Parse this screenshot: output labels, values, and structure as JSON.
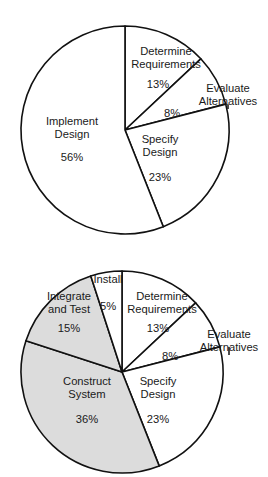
{
  "figure": {
    "background_color": "#ffffff",
    "line_color": "#111111",
    "fill_white": "#ffffff",
    "fill_gray": "#dcdcdc",
    "ghost_title": ""
  },
  "chart_data": [
    {
      "type": "pie",
      "id": "top-pie",
      "title": "",
      "legend": "none",
      "start_angle_deg": 0,
      "direction": "clockwise",
      "center": [
        125,
        130
      ],
      "radius": 104,
      "categories": [
        "Determine Requirements",
        "Evaluate Alternatives",
        "Specify Design",
        "Implement Design"
      ],
      "values": [
        13,
        8,
        23,
        56
      ],
      "value_labels": [
        "13%",
        "8%",
        "23%",
        "56%"
      ],
      "slices": [
        {
          "label_line1": "Determine",
          "label_line2": "Requirements",
          "value": 13,
          "value_label": "13%",
          "fill": "#ffffff",
          "label_x": 166,
          "label_y1": 55,
          "label_y2": 68,
          "pct_x": 158,
          "pct_y": 88,
          "leader": false
        },
        {
          "label_line1": "Evaluate",
          "label_line2": "Alternatives",
          "value": 8,
          "value_label": "8%",
          "fill": "#ffffff",
          "label_x": 228,
          "label_y1": 92,
          "label_y2": 105,
          "pct_x": 172,
          "pct_y": 117,
          "leader": true
        },
        {
          "label_line1": "Specify",
          "label_line2": "Design",
          "value": 23,
          "value_label": "23%",
          "fill": "#ffffff",
          "label_x": 160,
          "label_y1": 143,
          "label_y2": 156,
          "pct_x": 160,
          "pct_y": 181,
          "leader": false
        },
        {
          "label_line1": "Implement",
          "label_line2": "Design",
          "value": 56,
          "value_label": "56%",
          "fill": "#ffffff",
          "label_x": 72,
          "label_y1": 125,
          "label_y2": 138,
          "pct_x": 72,
          "pct_y": 161,
          "leader": false
        }
      ]
    },
    {
      "type": "pie",
      "id": "bottom-pie",
      "title": "",
      "legend": "none",
      "start_angle_deg": 0,
      "direction": "clockwise",
      "center": [
        122,
        372
      ],
      "radius": 101,
      "categories": [
        "Determine Requirements",
        "Evaluate Alternatives",
        "Specify Design",
        "Construct System",
        "Integrate and Test",
        "Install"
      ],
      "values": [
        13,
        8,
        23,
        36,
        15,
        5
      ],
      "value_labels": [
        "13%",
        "8%",
        "23%",
        "36%",
        "15%",
        "5%"
      ],
      "slices": [
        {
          "label_line1": "Determine",
          "label_line2": "Requirements",
          "value": 13,
          "value_label": "13%",
          "fill": "#ffffff",
          "label_x": 162,
          "label_y1": 300,
          "label_y2": 313,
          "pct_x": 158,
          "pct_y": 332,
          "leader": false
        },
        {
          "label_line1": "Evaluate",
          "label_line2": "Alternatives",
          "value": 8,
          "value_label": "8%",
          "fill": "#ffffff",
          "label_x": 229,
          "label_y1": 338,
          "label_y2": 351,
          "pct_x": 170,
          "pct_y": 360,
          "leader": true
        },
        {
          "label_line1": "Specify",
          "label_line2": "Design",
          "value": 23,
          "value_label": "23%",
          "fill": "#ffffff",
          "label_x": 158,
          "label_y1": 385,
          "label_y2": 398,
          "pct_x": 158,
          "pct_y": 423,
          "leader": false
        },
        {
          "label_line1": "Construct",
          "label_line2": "System",
          "value": 36,
          "value_label": "36%",
          "fill": "#dcdcdc",
          "label_x": 87,
          "label_y1": 385,
          "label_y2": 398,
          "pct_x": 87,
          "pct_y": 423,
          "leader": false
        },
        {
          "label_line1": "Integrate",
          "label_line2": "and Test",
          "value": 15,
          "value_label": "15%",
          "fill": "#dcdcdc",
          "label_x": 69,
          "label_y1": 300,
          "label_y2": 313,
          "pct_x": 69,
          "pct_y": 332,
          "leader": false
        },
        {
          "label_line1": "Install",
          "label_line2": "",
          "value": 5,
          "value_label": "5%",
          "fill": "#ffffff",
          "label_x": 108,
          "label_y1": 283,
          "label_y2": 0,
          "pct_x": 108,
          "pct_y": 310,
          "leader": false
        }
      ]
    }
  ]
}
